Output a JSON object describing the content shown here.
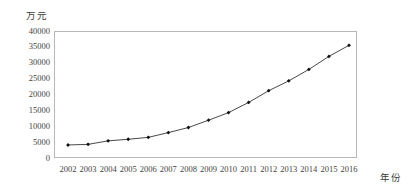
{
  "chart_data": {
    "type": "line",
    "title": "",
    "subtitle": "",
    "xlabel": "年份",
    "ylabel": "万元",
    "categories": [
      "2002",
      "2003",
      "2004",
      "2005",
      "2006",
      "2007",
      "2008",
      "2009",
      "2010",
      "2011",
      "2012",
      "2013",
      "2014",
      "2015",
      "2016"
    ],
    "x": [
      2002,
      2003,
      2004,
      2005,
      2006,
      2007,
      2008,
      2009,
      2010,
      2011,
      2012,
      2013,
      2014,
      2015,
      2016
    ],
    "series": [
      {
        "name": "",
        "values": [
          4100,
          4300,
          5400,
          5900,
          6500,
          8000,
          9600,
          11900,
          14300,
          17500,
          21200,
          24300,
          27900,
          32000,
          35500
        ]
      }
    ],
    "ylim": [
      0,
      40000
    ],
    "yticks": [
      0,
      5000,
      10000,
      15000,
      20000,
      25000,
      30000,
      35000,
      40000
    ],
    "ytick_labels": [
      "0",
      "5000",
      "10000",
      "15000",
      "20000",
      "25000",
      "30000",
      "35000",
      "40000"
    ],
    "xtick_labels": [
      "2002",
      "2003",
      "2004",
      "2005",
      "2006",
      "2007",
      "2008",
      "2009",
      "2010",
      "2011",
      "2012",
      "2013",
      "2014",
      "2015",
      "2016"
    ],
    "grid": false,
    "legend": false,
    "legend_position": "none",
    "marker": "diamond",
    "line_color": "#333333",
    "marker_color": "#111111",
    "frame_color": "#b8b8b8",
    "background": "#ffffff"
  },
  "labels": {
    "y_unit": "万元",
    "x_unit": "年份"
  }
}
